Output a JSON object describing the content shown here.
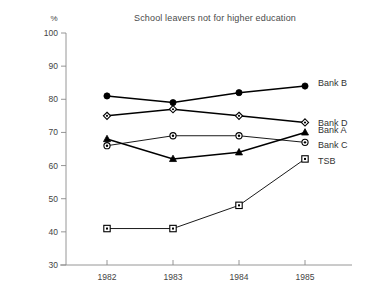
{
  "chart_data": {
    "type": "line",
    "title": "School leavers not for higher education",
    "xlabel": "",
    "ylabel": "%",
    "categories": [
      "1982",
      "1983",
      "1984",
      "1985"
    ],
    "x": [
      1982,
      1983,
      1984,
      1985
    ],
    "ylim": [
      30,
      100
    ],
    "yticks": [
      30,
      40,
      50,
      60,
      70,
      80,
      90,
      100
    ],
    "ytick_labels": [
      "30",
      "40",
      "50",
      "60",
      "70",
      "80",
      "90",
      "100"
    ],
    "grid": false,
    "legend_position": "right-inline",
    "series": [
      {
        "name": "Bank B",
        "label": "Bank B",
        "marker": "filled-circle",
        "values": [
          81,
          79,
          82,
          84
        ]
      },
      {
        "name": "Bank D",
        "label": "Bank D",
        "marker": "open-diamond",
        "values": [
          75,
          77,
          75,
          73
        ]
      },
      {
        "name": "Bank A",
        "label": "Bank A",
        "marker": "filled-triangle",
        "values": [
          68,
          62,
          64,
          70
        ]
      },
      {
        "name": "Bank C",
        "label": "Bank C",
        "marker": "dotted-circle",
        "values": [
          66,
          69,
          69,
          67
        ]
      },
      {
        "name": "TSB",
        "label": "TSB",
        "marker": "open-square",
        "values": [
          41,
          41,
          48,
          62
        ]
      }
    ]
  },
  "axis": {
    "unit_label": "%"
  },
  "colors": {
    "ink": "#000000",
    "axis": "#8a8a8a",
    "text": "#444444",
    "background": "#ffffff"
  }
}
